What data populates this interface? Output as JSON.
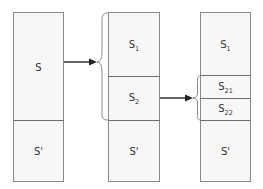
{
  "diagram": {
    "type": "set-partition-refinement",
    "colors": {
      "box_fill": "#f7f7f7",
      "box_stroke": "#8a8a8a",
      "divider": "#6e6e6e",
      "arrow": "#222222",
      "text": "#333333"
    },
    "columns": [
      {
        "id": "stage-1",
        "segments": [
          {
            "label": "S",
            "sub": ""
          },
          {
            "label": "S'",
            "sub": ""
          }
        ]
      },
      {
        "id": "stage-2",
        "segments": [
          {
            "label": "S",
            "sub": "1"
          },
          {
            "label": "S",
            "sub": "2"
          },
          {
            "label": "S'",
            "sub": ""
          }
        ]
      },
      {
        "id": "stage-3",
        "segments": [
          {
            "label": "S",
            "sub": "1"
          },
          {
            "label": "S",
            "sub": "21"
          },
          {
            "label": "S",
            "sub": "22"
          },
          {
            "label": "S'",
            "sub": ""
          }
        ]
      }
    ],
    "edges": [
      {
        "from": "stage-1.S",
        "to": "stage-2.{S1,S2}",
        "style": "arrow-with-brace"
      },
      {
        "from": "stage-2.S2",
        "to": "stage-3.{S21,S22}",
        "style": "arrow-with-brace"
      }
    ]
  }
}
